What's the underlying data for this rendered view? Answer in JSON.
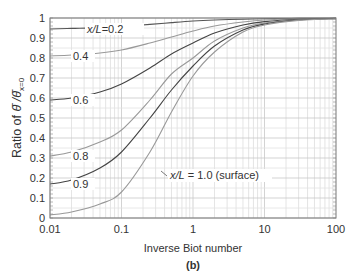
{
  "chart_data": {
    "type": "line",
    "title": "",
    "caption": "(b)",
    "xlabel": "Inverse Biot number",
    "ylabel_prefix": "Ratio of ",
    "ylabel_math": "θ̄ / θ̄x=0",
    "xscale": "log",
    "xlim": [
      0.01,
      100
    ],
    "ylim": [
      0,
      1
    ],
    "grid": true,
    "x_ticks": [
      {
        "value": 0.01,
        "label": "0.01"
      },
      {
        "value": 0.1,
        "label": "0.1"
      },
      {
        "value": 1,
        "label": "1"
      },
      {
        "value": 10,
        "label": "10"
      },
      {
        "value": 100,
        "label": "100"
      }
    ],
    "y_ticks": [
      {
        "value": 0,
        "label": "0"
      },
      {
        "value": 0.1,
        "label": "0.1"
      },
      {
        "value": 0.2,
        "label": "0.2"
      },
      {
        "value": 0.3,
        "label": "0.3"
      },
      {
        "value": 0.4,
        "label": "0.4"
      },
      {
        "value": 0.5,
        "label": "0.5"
      },
      {
        "value": 0.6,
        "label": "0.6"
      },
      {
        "value": 0.7,
        "label": "0.7"
      },
      {
        "value": 0.8,
        "label": "0.8"
      },
      {
        "value": 0.9,
        "label": "0.9"
      },
      {
        "value": 1,
        "label": "1"
      }
    ],
    "x": [
      0.01,
      0.02,
      0.05,
      0.1,
      0.25,
      0.5,
      1,
      2,
      5,
      10,
      30,
      100
    ],
    "series": [
      {
        "name": "x/L=0.2",
        "label": "x/L=0.2",
        "color": "#555555",
        "values": [
          0.945,
          0.948,
          0.952,
          0.958,
          0.968,
          0.977,
          0.985,
          0.99,
          0.994,
          0.996,
          0.998,
          0.999
        ]
      },
      {
        "name": "x/L=0.4",
        "label": "0.4",
        "color": "#999999",
        "values": [
          0.81,
          0.815,
          0.825,
          0.84,
          0.875,
          0.905,
          0.935,
          0.96,
          0.98,
          0.99,
          0.996,
          0.999
        ]
      },
      {
        "name": "x/L=0.6",
        "label": "0.6",
        "color": "#444444",
        "values": [
          0.59,
          0.6,
          0.63,
          0.67,
          0.75,
          0.82,
          0.875,
          0.925,
          0.965,
          0.982,
          0.994,
          0.998
        ]
      },
      {
        "name": "x/L=0.8",
        "label": "0.8",
        "color": "#999999",
        "values": [
          0.31,
          0.33,
          0.38,
          0.44,
          0.59,
          0.72,
          0.8,
          0.885,
          0.95,
          0.975,
          0.991,
          0.997
        ]
      },
      {
        "name": "x/L=0.9",
        "label": "0.9",
        "color": "#444444",
        "values": [
          0.17,
          0.19,
          0.25,
          0.33,
          0.5,
          0.64,
          0.76,
          0.86,
          0.94,
          0.97,
          0.99,
          0.997
        ]
      },
      {
        "name": "x/L=1.0 (surface)",
        "label": "x/L = 1.0 (surface)",
        "color": "#999999",
        "values": [
          0.015,
          0.03,
          0.07,
          0.13,
          0.33,
          0.53,
          0.71,
          0.83,
          0.93,
          0.965,
          0.988,
          0.996
        ]
      }
    ]
  }
}
